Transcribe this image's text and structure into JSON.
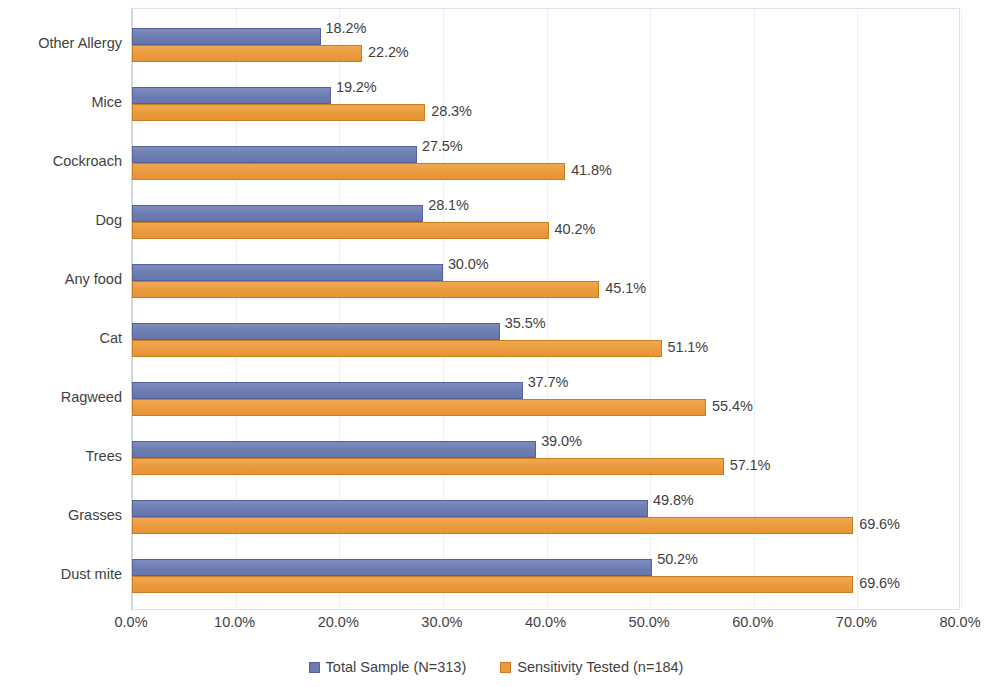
{
  "chart_data": {
    "type": "bar",
    "orientation": "horizontal",
    "title": "",
    "xlabel": "",
    "ylabel": "",
    "xlim": [
      0,
      80
    ],
    "xtick_step": 10,
    "grid": true,
    "legend_position": "bottom",
    "value_format": "percent_one_decimal",
    "xticks": [
      "0.0%",
      "10.0%",
      "20.0%",
      "30.0%",
      "40.0%",
      "50.0%",
      "60.0%",
      "70.0%",
      "80.0%"
    ],
    "categories": [
      "Other Allergy",
      "Mice",
      "Cockroach",
      "Dog",
      "Any food",
      "Cat",
      "Ragweed",
      "Trees",
      "Grasses",
      "Dust mite"
    ],
    "series": [
      {
        "name": "Total Sample (N=313)",
        "color": "#6d7cb0",
        "values": [
          18.2,
          19.2,
          27.5,
          28.1,
          30.0,
          35.5,
          37.7,
          39.0,
          49.8,
          50.2
        ],
        "labels": [
          "18.2%",
          "19.2%",
          "27.5%",
          "28.1%",
          "30.0%",
          "35.5%",
          "37.7%",
          "39.0%",
          "49.8%",
          "50.2%"
        ]
      },
      {
        "name": "Sensitivity Tested (n=184)",
        "color": "#ea9a3c",
        "values": [
          22.2,
          28.3,
          41.8,
          40.2,
          45.1,
          51.1,
          55.4,
          57.1,
          69.6,
          69.6
        ],
        "labels": [
          "22.2%",
          "28.3%",
          "41.8%",
          "40.2%",
          "45.1%",
          "51.1%",
          "55.4%",
          "57.1%",
          "69.6%",
          "69.6%"
        ]
      }
    ]
  },
  "legend": {
    "items": [
      {
        "label": "Total Sample (N=313)",
        "color": "#6d7cb0"
      },
      {
        "label": "Sensitivity Tested (n=184)",
        "color": "#ea9a3c"
      }
    ]
  }
}
